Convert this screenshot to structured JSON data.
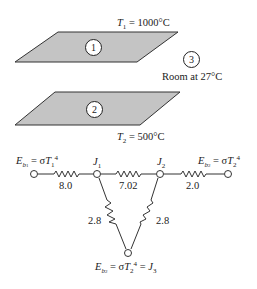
{
  "diagram": {
    "plates": [
      {
        "id": "1",
        "label": "1",
        "temp_var": "T",
        "temp_sub": "1",
        "temp_value": "= 1000°C"
      },
      {
        "id": "2",
        "label": "2",
        "temp_var": "T",
        "temp_sub": "2",
        "temp_value": "= 500°C"
      }
    ],
    "room": {
      "label": "3",
      "text": "Room at 27°C"
    },
    "circuit": {
      "nodes": {
        "left": {
          "E": "E",
          "b_sub": "b",
          "b_subsub": "1",
          "eq": " = σ",
          "T": "T",
          "T_sub": "1",
          "pow": "4"
        },
        "J1": {
          "J": "J",
          "sub": "1"
        },
        "J2": {
          "J": "J",
          "sub": "2"
        },
        "right": {
          "E": "E",
          "b_sub": "b",
          "b_subsub": "2",
          "eq": " = σ",
          "T": "T",
          "T_sub": "2",
          "pow": "4"
        },
        "bottom": {
          "E": "E",
          "b_sub": "b",
          "b_subsub": "2",
          "eq": " = σ",
          "T": "T",
          "T_sub": "2",
          "pow": "4",
          "eq2": " = ",
          "J": "J",
          "J_sub": "3"
        }
      },
      "resistances": {
        "left_to_J1": "8.0",
        "J1_to_J2": "7.02",
        "J2_to_right": "2.0",
        "J1_to_J3": "2.8",
        "J2_to_J3": "2.8"
      }
    },
    "colors": {
      "plate_fill": "#c4c4c4",
      "line": "#333333",
      "background": "#ffffff"
    }
  }
}
